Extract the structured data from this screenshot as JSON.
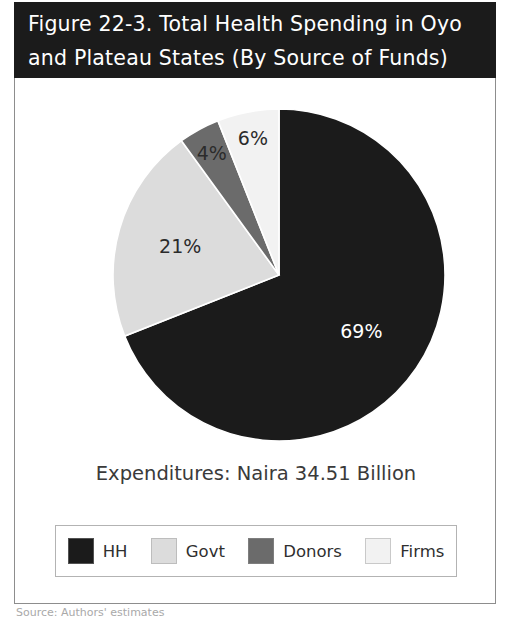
{
  "figure": {
    "title": "Figure 22-3.  Total Health Spending in Oyo\nand Plateau States (By Source of Funds)",
    "expenditures_caption": "Expenditures: Naira 34.51 Billion",
    "source_note": "Source: Authors' estimates"
  },
  "colors": {
    "title_band_bg": "#1b1b1b",
    "title_band_fg": "#ffffff",
    "frame_border": "#8d8d8d",
    "legend_border": "#b3b3b3",
    "hh": "#1b1b1b",
    "govt": "#dcdcdc",
    "donors": "#6b6b6b",
    "firms": "#f2f2f2",
    "label_on_dark": "#ffffff",
    "label_on_light": "#2b2b2b",
    "caption_text": "#3a3a3a"
  },
  "legend": {
    "entries": [
      {
        "label": "HH",
        "color": "#1b1b1b",
        "swatch_name": "legend-swatch-hh"
      },
      {
        "label": "Govt",
        "color": "#dcdcdc",
        "swatch_name": "legend-swatch-govt"
      },
      {
        "label": "Donors",
        "color": "#6b6b6b",
        "swatch_name": "legend-swatch-donors"
      },
      {
        "label": "Firms",
        "color": "#f2f2f2",
        "swatch_name": "legend-swatch-firms"
      }
    ]
  },
  "chart_data": {
    "type": "pie",
    "title": "Figure 22-3.  Total Health Spending in Oyo and Plateau States (By Source of Funds)",
    "subtitle": "Expenditures: Naira 34.51 Billion",
    "xlabel": "",
    "ylabel": "",
    "units": "percent of total health spending",
    "total_label": "Expenditures: Naira 34.51 Billion",
    "total_value": 34.51,
    "total_units": "Naira Billion",
    "legend_position": "bottom",
    "start_angle_deg": 0,
    "direction": "clockwise",
    "categories": [
      "HH",
      "Govt",
      "Donors",
      "Firms"
    ],
    "values": [
      69,
      21,
      4,
      6
    ],
    "data_labels": [
      "69%",
      "21%",
      "4%",
      "6%"
    ],
    "slices": [
      {
        "name": "HH",
        "value": 69,
        "label": "69%",
        "color": "#1b1b1b",
        "label_color": "#ffffff"
      },
      {
        "name": "Govt",
        "value": 21,
        "label": "21%",
        "color": "#dcdcdc",
        "label_color": "#2b2b2b"
      },
      {
        "name": "Donors",
        "value": 4,
        "label": "4%",
        "color": "#6b6b6b",
        "label_color": "#2b2b2b"
      },
      {
        "name": "Firms",
        "value": 6,
        "label": "6%",
        "color": "#f2f2f2",
        "label_color": "#2b2b2b"
      }
    ]
  }
}
